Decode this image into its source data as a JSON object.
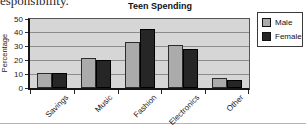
{
  "page": {
    "cropped_text": "esponsibility."
  },
  "chart_data": {
    "type": "bar",
    "title": "Teen Spending",
    "xlabel": "",
    "ylabel": "Percentage",
    "categories": [
      "Savings",
      "Music",
      "Fashion",
      "Electronics",
      "Other"
    ],
    "series": [
      {
        "name": "Male",
        "color": "#ababab",
        "border": "#2b2b2b",
        "values": [
          11,
          22,
          33,
          31,
          7
        ]
      },
      {
        "name": "Female",
        "color": "#262626",
        "border": "#000000",
        "values": [
          11,
          20,
          43,
          28,
          6
        ]
      }
    ],
    "ylim": [
      0,
      50
    ],
    "yticks": [
      0,
      10,
      20,
      30,
      40,
      50
    ],
    "grid": true,
    "legend_position": "top-right",
    "colors": {
      "plot_background": "#d6d6d6",
      "gridline": "#8c8c8c",
      "axis": "#151515"
    }
  }
}
